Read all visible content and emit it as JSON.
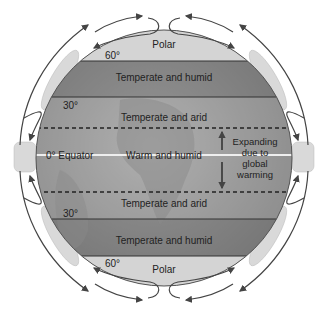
{
  "diagram": {
    "title": "",
    "zones": [
      {
        "id": "polar-north",
        "label": "Polar"
      },
      {
        "id": "temperate-humid-north",
        "label": "Temperate and humid"
      },
      {
        "id": "temperate-arid-north",
        "label": "Temperate and arid"
      },
      {
        "id": "warm-humid",
        "label": "Warm and humid"
      },
      {
        "id": "temperate-arid-south",
        "label": "Temperate and arid"
      },
      {
        "id": "temperate-humid-south",
        "label": "Temperate and humid"
      },
      {
        "id": "polar-south",
        "label": "Polar"
      }
    ],
    "latitudes": {
      "north60": "60°",
      "north30": "30°",
      "equator": "0° Equator",
      "south30": "30°",
      "south60": "60°"
    },
    "annotation": {
      "line1": "Expanding",
      "line2": "due to",
      "line3": "global",
      "line4": "warming"
    },
    "colors": {
      "globe_dark": "#6e6e6e",
      "globe_mid": "#9a9a9a",
      "globe_light": "#c8c8c8",
      "polar": "#d6d6d6",
      "line": "#333333",
      "arrow": "#444444"
    }
  }
}
